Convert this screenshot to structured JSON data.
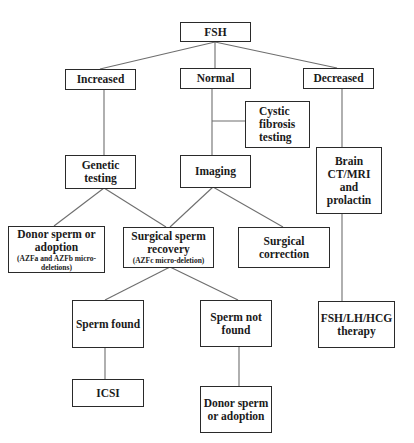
{
  "diagram": {
    "type": "flowchart",
    "line_color": "#6e6e6e",
    "border_color": "#2a2a2a",
    "nodes": {
      "fsh": {
        "lines": [
          "FSH"
        ]
      },
      "increased": {
        "lines": [
          "Increased"
        ]
      },
      "normal": {
        "lines": [
          "Normal"
        ]
      },
      "decreased": {
        "lines": [
          "Decreased"
        ]
      },
      "cystic": {
        "lines": [
          "Cystic",
          "fibrosis",
          "testing"
        ]
      },
      "genetic": {
        "lines": [
          "Genetic",
          "testing"
        ]
      },
      "imaging": {
        "lines": [
          "Imaging"
        ]
      },
      "brain": {
        "lines": [
          "Brain",
          "CT/MRI",
          "and",
          "prolactin"
        ]
      },
      "donor1": {
        "lines": [
          "Donor sperm or",
          "adoption"
        ],
        "sub": [
          "(AZFa and AZFb micro-",
          "deletions)"
        ]
      },
      "surgical_recovery": {
        "lines": [
          "Surgical sperm",
          "recovery"
        ],
        "sub": [
          "(AZFc micro-deletion)"
        ]
      },
      "surgical_correction": {
        "lines": [
          "Surgical",
          "correction"
        ]
      },
      "sperm_found": {
        "lines": [
          "Sperm found"
        ]
      },
      "sperm_not_found": {
        "lines": [
          "Sperm not",
          "found"
        ]
      },
      "hormone_therapy": {
        "lines": [
          "FSH/LH/HCG",
          "therapy"
        ]
      },
      "icsi": {
        "lines": [
          "ICSI"
        ]
      },
      "donor2": {
        "lines": [
          "Donor sperm",
          "or adoption"
        ]
      }
    },
    "edges": [
      [
        "FSH",
        "Increased"
      ],
      [
        "FSH",
        "Normal"
      ],
      [
        "FSH",
        "Decreased"
      ],
      [
        "Normal",
        "Cystic fibrosis testing"
      ],
      [
        "Normal",
        "Imaging"
      ],
      [
        "Increased",
        "Genetic testing"
      ],
      [
        "Decreased",
        "Brain CT/MRI and prolactin"
      ],
      [
        "Genetic testing",
        "Donor sperm or adoption"
      ],
      [
        "Genetic testing",
        "Surgical sperm recovery"
      ],
      [
        "Imaging",
        "Surgical sperm recovery"
      ],
      [
        "Imaging",
        "Surgical correction"
      ],
      [
        "Surgical sperm recovery",
        "Sperm found"
      ],
      [
        "Surgical sperm recovery",
        "Sperm not found"
      ],
      [
        "Brain CT/MRI and prolactin",
        "FSH/LH/HCG therapy"
      ],
      [
        "Sperm found",
        "ICSI"
      ],
      [
        "Sperm not found",
        "Donor sperm or adoption"
      ]
    ]
  }
}
